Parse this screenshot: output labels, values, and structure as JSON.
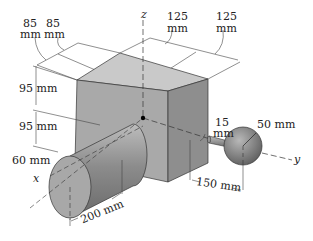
{
  "figure": {
    "axes": {
      "x": "x",
      "y": "y",
      "z": "z"
    },
    "dimensions": {
      "box_depth_1": "85\nmm",
      "box_depth_1_num": "85",
      "box_depth_1_unit": "mm",
      "box_depth_2_num": "85",
      "box_depth_2_unit": "mm",
      "box_width_1_num": "125",
      "box_width_1_unit": "mm",
      "box_width_2_num": "125",
      "box_width_2_unit": "mm",
      "height_upper": "95 mm",
      "height_lower": "95 mm",
      "cylinder_radius": "60 mm",
      "cylinder_length": "200 mm",
      "rod_diameter_num": "15",
      "rod_diameter_unit": "mm",
      "sphere_radius": "50 mm",
      "rod_length": "150 mm"
    },
    "colors": {
      "box_top": "#c9c9c9",
      "box_left": "#a9a9a9",
      "box_right": "#8e8e8e",
      "cylinder": "#8f8f8f",
      "cylinder_end": "#a8a8a8",
      "sphere": "#8a8a8a",
      "line": "#333333"
    }
  }
}
